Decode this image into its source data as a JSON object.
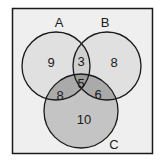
{
  "diagram": {
    "type": "venn-3",
    "sets": [
      {
        "name": "A",
        "label": "A"
      },
      {
        "name": "B",
        "label": "B"
      },
      {
        "name": "C",
        "label": "C"
      }
    ],
    "regions": {
      "a_only": "9",
      "b_only": "8",
      "c_only": "10",
      "a_and_b_only": "3",
      "a_and_c_only": "8",
      "b_and_c_only": "6",
      "a_b_c": "5"
    },
    "colors": {
      "background": "#efefef",
      "border": "#1a1a1a",
      "ab_fill": "#e0e0e0",
      "c_fill": "#c4c4c4",
      "outline": "#1a1a1a"
    }
  }
}
